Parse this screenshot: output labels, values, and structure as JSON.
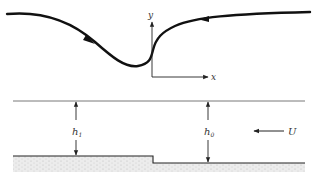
{
  "figure": {
    "upper_panel": {
      "description": "streamline over depression with coordinate axes",
      "axis_x_label": "x",
      "axis_y_label": "y",
      "stroke_color": "#111111"
    },
    "lower_panel": {
      "description": "channel flow over a step in the bed",
      "depth_upstream_label": "h",
      "depth_upstream_sub": "1",
      "depth_downstream_label": "h",
      "depth_downstream_sub": "0",
      "velocity_label": "U",
      "bed_fill_color": "#d8d8d8",
      "line_color": "#222222"
    }
  }
}
